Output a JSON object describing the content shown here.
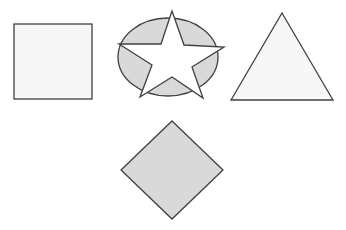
{
  "canvas": {
    "width": 346,
    "height": 230,
    "background": "#ffffff"
  },
  "colors": {
    "stroke": "#404040",
    "light_fill": "#f7f7f7",
    "gray_fill": "#d9d9d9",
    "star_fill": "#ffffff"
  },
  "shapes": [
    {
      "id": "square",
      "type": "rect",
      "x": 14,
      "y": 24,
      "width": 78,
      "height": 75,
      "fill": "light"
    },
    {
      "id": "ellipse",
      "type": "ellipse",
      "cx": 168,
      "cy": 57,
      "rx": 50,
      "ry": 39,
      "fill": "gray"
    },
    {
      "id": "star",
      "type": "polygon",
      "points": "172,11 184,45 224,47 192,67 203,98 172,77 140,97 152,65 119,44 161,44",
      "fill": "white"
    },
    {
      "id": "triangle",
      "type": "polygon",
      "points": "282,13 333,100 231,100",
      "fill": "light"
    },
    {
      "id": "diamond",
      "type": "polygon",
      "points": "172,121 223,170 172,219 121,170",
      "fill": "gray"
    }
  ]
}
